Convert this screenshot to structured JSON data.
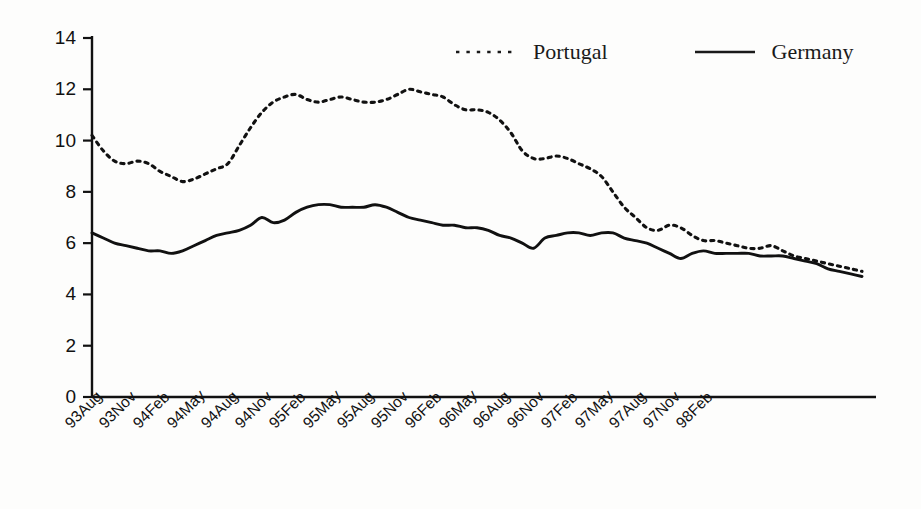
{
  "chart_data": {
    "type": "line",
    "title": "",
    "subtitle": "",
    "xlabel": "",
    "ylabel": "",
    "ylim": [
      0,
      14
    ],
    "yticks": [
      0,
      2,
      4,
      6,
      8,
      10,
      12,
      14
    ],
    "grid": false,
    "legend_position": "top-center",
    "categories": [
      "93Aug",
      "93Sep",
      "93Oct",
      "93Nov",
      "93Dec",
      "94Jan",
      "94Feb",
      "94Mar",
      "94Apr",
      "94May",
      "94Jun",
      "94Jul",
      "94Aug",
      "94Sep",
      "94Oct",
      "94Nov",
      "94Dec",
      "95Jan",
      "95Feb",
      "95Mar",
      "95Apr",
      "95May",
      "95Jun",
      "95Jul",
      "95Aug",
      "95Sep",
      "95Oct",
      "95Nov",
      "95Dec",
      "96Jan",
      "96Feb",
      "96Mar",
      "96Apr",
      "96May",
      "96Jun",
      "96Jul",
      "96Aug",
      "96Sep",
      "96Oct",
      "96Nov",
      "96Dec",
      "97Jan",
      "97Feb",
      "97Mar",
      "97Apr",
      "97May",
      "97Jun",
      "97Jul",
      "97Aug",
      "97Sep",
      "97Oct",
      "97Nov",
      "97Dec",
      "98Jan",
      "98Feb",
      "98Mar",
      "98Apr"
    ],
    "xtick_labels": [
      "93Aug",
      "93Nov",
      "94Feb",
      "94May",
      "94Aug",
      "94Nov",
      "95Feb",
      "95May",
      "95Aug",
      "95Nov",
      "96Feb",
      "96May",
      "96Aug",
      "96Nov",
      "97Feb",
      "97May",
      "97Aug",
      "97Nov",
      "98Feb"
    ],
    "xtick_rotation_deg": -45,
    "series": [
      {
        "name": "Portugal",
        "style": "dotted",
        "color": "#111111",
        "values": [
          10.2,
          9.6,
          9.2,
          9.1,
          9.2,
          9.1,
          8.8,
          8.6,
          8.4,
          8.5,
          8.7,
          8.9,
          9.1,
          9.8,
          10.5,
          11.1,
          11.5,
          11.7,
          11.8,
          11.6,
          11.5,
          11.6,
          11.7,
          11.6,
          11.5,
          11.5,
          11.6,
          11.8,
          12.0,
          11.9,
          11.8,
          11.7,
          11.4,
          11.2,
          11.2,
          11.1,
          10.8,
          10.3,
          9.6,
          9.3,
          9.3,
          9.4,
          9.3,
          9.1,
          8.9,
          8.6,
          8.0,
          7.4,
          7.0,
          6.6,
          6.5,
          6.7,
          6.6,
          6.3,
          6.1,
          6.1,
          6.0
        ]
      },
      {
        "name": "Germany",
        "style": "solid",
        "color": "#111111",
        "values": [
          6.4,
          6.2,
          6.0,
          5.9,
          5.8,
          5.7,
          5.7,
          5.6,
          5.7,
          5.9,
          6.1,
          6.3,
          6.4,
          6.5,
          6.7,
          7.0,
          6.8,
          6.9,
          7.2,
          7.4,
          7.5,
          7.5,
          7.4,
          7.4,
          7.4,
          7.5,
          7.4,
          7.2,
          7.0,
          6.9,
          6.8,
          6.7,
          6.7,
          6.6,
          6.6,
          6.5,
          6.3,
          6.2,
          6.0,
          5.8,
          6.2,
          6.3,
          6.4,
          6.4,
          6.3,
          6.4,
          6.4,
          6.2,
          6.1,
          6.0,
          5.8,
          5.6,
          5.4,
          5.6,
          5.7,
          5.6,
          5.6
        ]
      }
    ],
    "tail_series": {
      "Portugal": [
        5.9,
        5.8,
        5.8,
        5.9,
        5.7,
        5.5,
        5.4,
        5.3,
        5.2,
        5.1,
        5.0,
        4.9
      ],
      "Germany": [
        5.6,
        5.6,
        5.5,
        5.5,
        5.5,
        5.4,
        5.3,
        5.2,
        5.0,
        4.9,
        4.8,
        4.7
      ]
    }
  },
  "legend": {
    "entries": [
      {
        "label": "Portugal",
        "marker": "dotted-line-marker"
      },
      {
        "label": "Germany",
        "marker": "solid-line-marker"
      }
    ]
  },
  "axes": {
    "y_tick_labels": [
      "14",
      "12",
      "10",
      "8",
      "6",
      "4",
      "2",
      "0"
    ],
    "x_tick_labels": [
      "93Aug",
      "93Nov",
      "94Feb",
      "94May",
      "94Aug",
      "94Nov",
      "95Feb",
      "95May",
      "95Aug",
      "95Nov",
      "96Feb",
      "96May",
      "96Aug",
      "96Nov",
      "97Feb",
      "97May",
      "97Aug",
      "97Nov",
      "98Feb"
    ]
  },
  "colors": {
    "axis": "#111111",
    "portugal": "#111111",
    "germany": "#111111",
    "background": "#fdfdfc"
  }
}
